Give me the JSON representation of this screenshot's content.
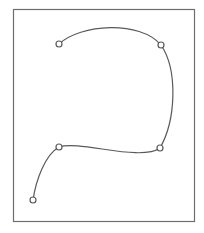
{
  "canvas": {
    "width": 204,
    "height": 233,
    "background": "#ffffff"
  },
  "frame": {
    "x": 13,
    "y": 9,
    "width": 181,
    "height": 212,
    "stroke": "#6e6e6e",
    "stroke_width": 1.2
  },
  "curve": {
    "stroke": "#5a5a5a",
    "stroke_width": 1.2,
    "path": "M 59 44 C 80 24, 140 20, 161 45 C 178 70, 176 120, 160 148 C 140 162, 80 140, 59 147 C 45 155, 36 180, 33 200"
  },
  "control_points": [
    {
      "id": "p1",
      "x": 59,
      "y": 44
    },
    {
      "id": "p2",
      "x": 161,
      "y": 45
    },
    {
      "id": "p3",
      "x": 160,
      "y": 148
    },
    {
      "id": "p4",
      "x": 59,
      "y": 147
    },
    {
      "id": "p5",
      "x": 33,
      "y": 200
    }
  ],
  "marker": {
    "radius": 3,
    "fill": "#ffffff",
    "stroke": "#5a5a5a",
    "stroke_width": 1.2
  }
}
